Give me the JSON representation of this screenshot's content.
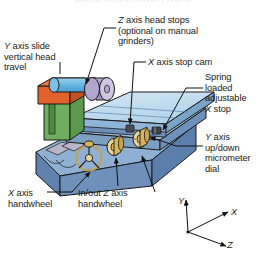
{
  "figure": {
    "kind": "technical-illustration",
    "subject": "surface grinder",
    "clipped_title": "Manual Surface Grinder Controls",
    "background": "#ffffff",
    "line_color": "#111111",
    "text_color": "#1a1a1a"
  },
  "callouts": [
    {
      "id": "y-axis-slide",
      "text": "Y axis slide\nvertical head\ntravel",
      "italic_prefix": "Y",
      "align": "left"
    },
    {
      "id": "z-axis-head-stops",
      "text": "Z axis head stops\n(optional on manual\ngrinders)",
      "italic_prefix": "Z",
      "align": "left"
    },
    {
      "id": "x-axis-stop-cam",
      "text": "X axis stop cam",
      "italic_prefix": "X",
      "align": "left"
    },
    {
      "id": "spring-loaded-x-stop",
      "text": "Spring\nloaded\nadjustable\nX stop",
      "italic_prefix": "X",
      "align": "left"
    },
    {
      "id": "y-axis-micrometer-dial",
      "text": "Y axis\nup/down\nmicrometer\ndial",
      "italic_prefix": "Y",
      "align": "left"
    },
    {
      "id": "x-axis-handwheel",
      "text": "X axis\nhandwheel",
      "italic_prefix": "X",
      "align": "left"
    },
    {
      "id": "z-axis-handwheel",
      "text": "In/out Z axis\nhandwheel",
      "italic_prefix": "Z",
      "align": "left"
    }
  ],
  "axis_indicator": {
    "name": "axis-triad",
    "origin_label": "",
    "axes": [
      {
        "label": "Y",
        "direction": "up"
      },
      {
        "label": "X",
        "direction": "upper-right"
      },
      {
        "label": "Z",
        "direction": "lower-right"
      }
    ]
  },
  "machine_parts": [
    {
      "name": "base",
      "color": "#6f90bb"
    },
    {
      "name": "base-front-face",
      "color": "#8aa8cd"
    },
    {
      "name": "base-slots",
      "color": "#b9b6c9"
    },
    {
      "name": "column",
      "color": "#6fae5e"
    },
    {
      "name": "spindle-housing",
      "color": "#e2622e"
    },
    {
      "name": "motor-cylinder",
      "color": "#6fb7e3"
    },
    {
      "name": "grinding-wheel",
      "color": "#a99bc6"
    },
    {
      "name": "grinding-wheel-face",
      "color": "#cfc6e0"
    },
    {
      "name": "table-top",
      "color": "#bcd8ec"
    },
    {
      "name": "table-edge",
      "color": "#8fb6d6"
    },
    {
      "name": "saddle",
      "color": "#9ab9d6"
    },
    {
      "name": "handwheel",
      "color": "#d8b45e"
    },
    {
      "name": "handwheel-hub",
      "color": "#e8d59a"
    },
    {
      "name": "micrometer-dial",
      "color": "#d8b45e"
    }
  ]
}
